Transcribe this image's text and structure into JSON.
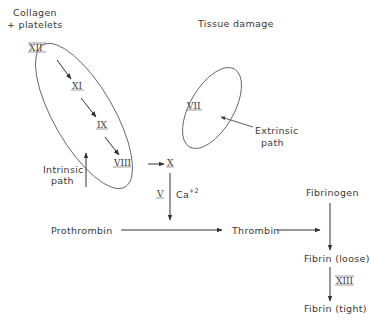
{
  "diagram": {
    "colors": {
      "line": "#333333",
      "text": "#3a3a3a",
      "background": "#ffffff"
    },
    "labels": {
      "collagen_line1": "Collagen",
      "collagen_line2": "+ platelets",
      "tissue_damage": "Tissue damage",
      "intrinsic_line1": "Intrinsic",
      "intrinsic_line2": "path",
      "extrinsic_line1": "Extrinsic",
      "extrinsic_line2": "path",
      "prothrombin": "Prothrombin",
      "thrombin": "Thrombin",
      "fibrinogen": "Fibrinogen",
      "fibrin_loose": "Fibrin (loose)",
      "fibrin_tight": "Fibrin (tight)",
      "calcium": "Ca",
      "calcium_charge": "+2"
    },
    "factors": {
      "f12": "XII",
      "f11": "XI",
      "f9": "IX",
      "f8": "VIII",
      "f7": "VII",
      "f10": "X",
      "f5": "V",
      "f13": "XIII"
    },
    "nodes": [
      {
        "id": "XII",
        "group": "intrinsic"
      },
      {
        "id": "XI",
        "group": "intrinsic"
      },
      {
        "id": "IX",
        "group": "intrinsic"
      },
      {
        "id": "VIII",
        "group": "intrinsic"
      },
      {
        "id": "VII",
        "group": "extrinsic"
      },
      {
        "id": "X"
      },
      {
        "id": "Prothrombin"
      },
      {
        "id": "Thrombin"
      },
      {
        "id": "Fibrinogen"
      },
      {
        "id": "Fibrin (loose)"
      },
      {
        "id": "Fibrin (tight)"
      }
    ],
    "edges": [
      {
        "from": "XII",
        "to": "XI"
      },
      {
        "from": "XI",
        "to": "IX"
      },
      {
        "from": "IX",
        "to": "VIII"
      },
      {
        "from": "VIII",
        "to": "X"
      },
      {
        "from": "X",
        "to": "Prothrombin->Thrombin",
        "label": "V, Ca+2"
      },
      {
        "from": "Prothrombin",
        "to": "Thrombin"
      },
      {
        "from": "Thrombin",
        "to": "Fibrinogen->Fibrin (loose)"
      },
      {
        "from": "Fibrinogen",
        "to": "Fibrin (loose)"
      },
      {
        "from": "Fibrin (loose)",
        "to": "Fibrin (tight)",
        "label": "XIII"
      }
    ]
  }
}
